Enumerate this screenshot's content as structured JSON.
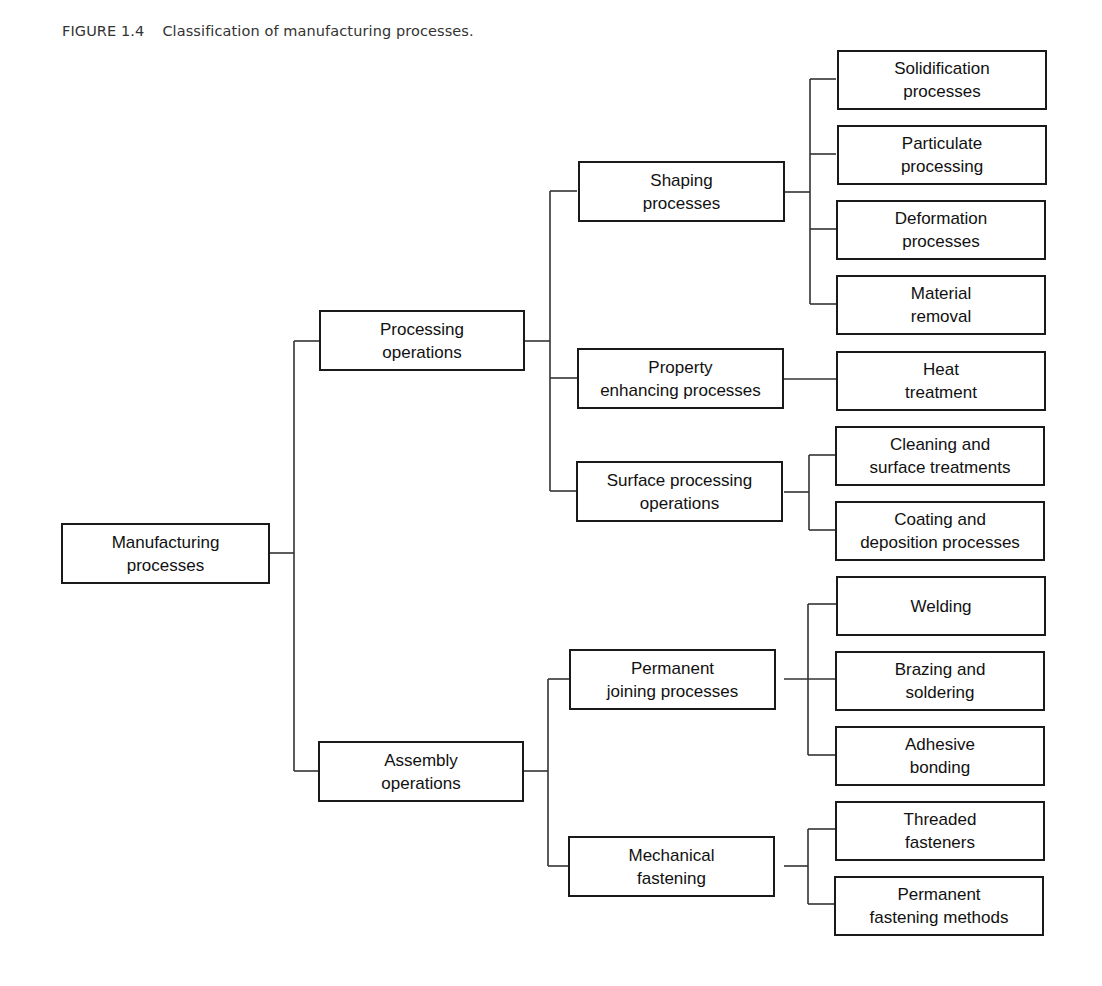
{
  "figure": {
    "number": "FIGURE 1.4",
    "caption": "Classification of manufacturing processes."
  },
  "tree": {
    "root": "Manufacturing\nprocesses",
    "level1": {
      "processing": "Processing\noperations",
      "assembly": "Assembly\noperations"
    },
    "level2": {
      "shaping": "Shaping\nprocesses",
      "property": "Property\nenhancing processes",
      "surface": "Surface processing\noperations",
      "joining": "Permanent\njoining processes",
      "mechanical": "Mechanical\nfastening"
    },
    "level3": {
      "solidification": "Solidification\nprocesses",
      "particulate": "Particulate\nprocessing",
      "deformation": "Deformation\nprocesses",
      "material_removal": "Material\nremoval",
      "heat_treatment": "Heat\ntreatment",
      "cleaning": "Cleaning and\nsurface treatments",
      "coating": "Coating and\ndeposition processes",
      "welding": "Welding",
      "brazing": "Brazing and\nsoldering",
      "adhesive": "Adhesive\nbonding",
      "threaded": "Threaded\nfasteners",
      "permanent_fastening": "Permanent\nfastening methods"
    }
  }
}
